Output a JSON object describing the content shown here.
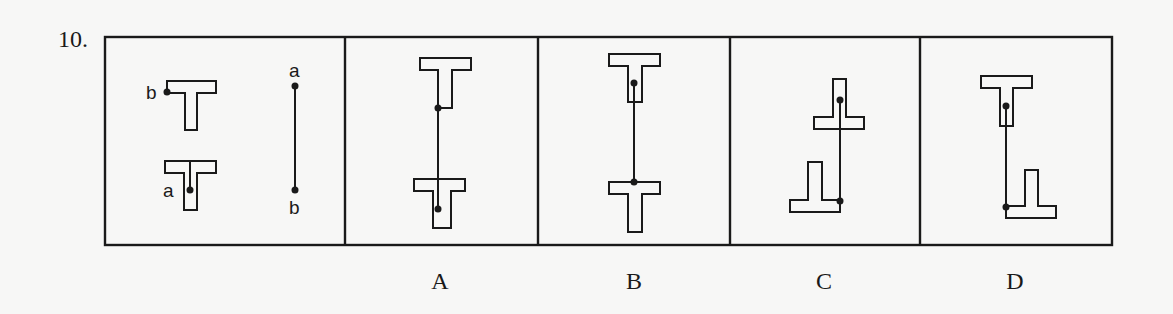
{
  "question": {
    "number": "10."
  },
  "prompt_panel": {
    "labels": {
      "t1_point": "b",
      "t2_point": "a",
      "segment_top": "a",
      "segment_bottom": "b"
    }
  },
  "options": [
    {
      "label": "A"
    },
    {
      "label": "B"
    },
    {
      "label": "C"
    },
    {
      "label": "D"
    }
  ],
  "colors": {
    "stroke": "#1a1a1a",
    "background": "#f7f7f6"
  }
}
